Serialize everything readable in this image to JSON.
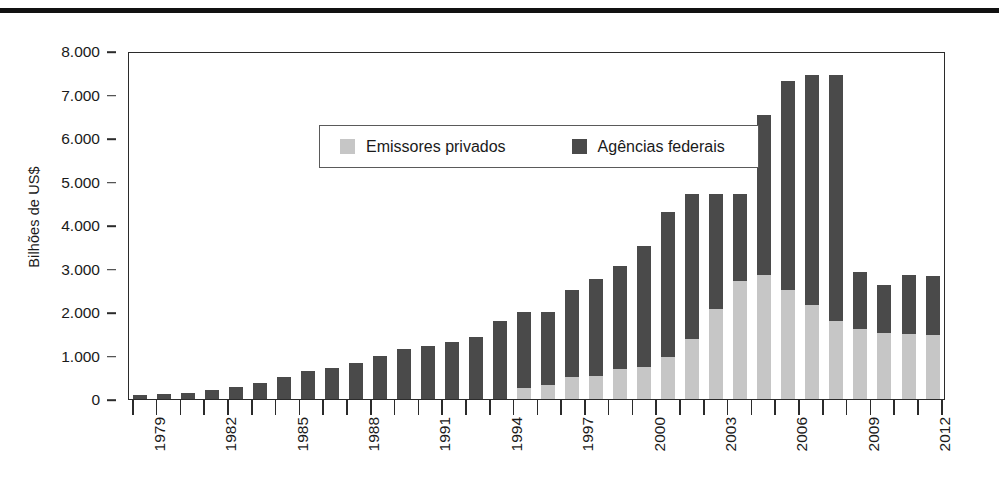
{
  "figure": {
    "top_rule": "horizontal-rule",
    "ylabel": "Bilhões de US$"
  },
  "legend": {
    "items": [
      {
        "label": "Emissores privados",
        "color": "#c6c6c6",
        "swatch": "legend-swatch-private"
      },
      {
        "label": "Agências federais",
        "color": "#4a4a4a",
        "swatch": "legend-swatch-federal"
      }
    ]
  },
  "chart_data": {
    "type": "bar",
    "stacked": true,
    "title": "",
    "xlabel": "",
    "ylabel": "Bilhões de US$",
    "ylim": [
      0,
      8000
    ],
    "yticks": [
      0,
      1000,
      2000,
      3000,
      4000,
      5000,
      6000,
      7000,
      8000
    ],
    "ytick_labels": [
      "0",
      "1.000",
      "2.000",
      "3.000",
      "4.000",
      "5.000",
      "6.000",
      "7.000",
      "8.000"
    ],
    "grid": false,
    "legend_position": "upper-left-inside",
    "categories": [
      "1979",
      "1980",
      "1981",
      "1982",
      "1983",
      "1984",
      "1985",
      "1986",
      "1987",
      "1988",
      "1989",
      "1990",
      "1991",
      "1992",
      "1993",
      "1994",
      "1995",
      "1996",
      "1997",
      "1998",
      "1999",
      "2000",
      "2001",
      "2002",
      "2003",
      "2004",
      "2005",
      "2006",
      "2007",
      "2008",
      "2009",
      "2010",
      "2011",
      "2012"
    ],
    "xtick_labels_shown": [
      "1979",
      "1982",
      "1985",
      "1988",
      "1991",
      "1994",
      "1997",
      "2000",
      "2003",
      "2006",
      "2009",
      "2012"
    ],
    "series": [
      {
        "name": "Emissores privados",
        "color": "#c6c6c6",
        "values": [
          0,
          0,
          0,
          0,
          0,
          0,
          0,
          0,
          0,
          0,
          0,
          0,
          0,
          0,
          0,
          0,
          250,
          320,
          500,
          540,
          700,
          740,
          960,
          1380,
          2080,
          2720,
          2860,
          2500,
          2150,
          1800,
          1600,
          1520,
          1500,
          1480
        ]
      },
      {
        "name": "Agências federais",
        "color": "#4a4a4a",
        "values": [
          100,
          110,
          130,
          200,
          270,
          370,
          500,
          640,
          720,
          830,
          1000,
          1150,
          1230,
          1320,
          1430,
          1800,
          1750,
          1680,
          2000,
          2230,
          2360,
          2770,
          3340,
          3330,
          2640,
          2000,
          3660,
          4800,
          5300,
          5650,
          1330,
          1100,
          1350,
          1350
        ]
      }
    ],
    "totals": [
      100,
      110,
      130,
      200,
      270,
      370,
      500,
      640,
      720,
      830,
      1000,
      1150,
      1230,
      1320,
      1430,
      1800,
      2000,
      2000,
      2500,
      2770,
      3060,
      3510,
      4300,
      4710,
      4720,
      4720,
      6520,
      7300,
      7450,
      7450,
      2930,
      2620,
      2850,
      2830
    ]
  }
}
